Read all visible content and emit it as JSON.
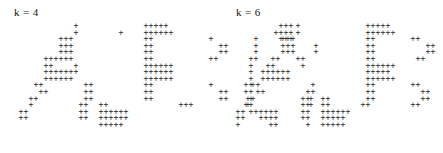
{
  "figure": {
    "glyph": "+",
    "glyph_color": "#262626",
    "background_color": "#ffffff",
    "cell_width": 5,
    "cell_height": 6.6,
    "grid_origin_x": 12,
    "grid_origin_y": 0
  },
  "panels": [
    {
      "id": "panel-left",
      "label": "k = 4",
      "rows": [
        "            +             +++++                      +++       ",
        "            +        +    ++++++                    ++++       ",
        "         +++              ++           +        +    +++       ",
        "         +++              ++             ++     +           +  ",
        "         +++              ++             ++     +           +  ",
        "      ++++++              ++           ++      ++              ",
        "      ++    +             ++++++               +               ",
        "      +++++++             ++++++               +               ",
        "      ++++++              ++++++               +               ",
        "    ++        ++          ++           +      ++               ",
        "     ++       ++          ++             ++   ++               ",
        "   ++         ++          ++             ++    +           +   ",
        "   +         ++  ++              +++          ++           +   ",
        " ++          ++  ++++++                        ++++++          ",
        " ++          ++  ++++++                          ++++          ",
        "                 +++++                             ++          "
      ]
    },
    {
      "id": "panel-right",
      "label": "k = 6",
      "rows": [
        "            +             +++++                     ++++       ",
        "            +             ++++++                   +++++       ",
        "         +++              ++       ++             ++ +++       ",
        "         +++              ++          ++        +          +   ",
        "         +++              ++          ++        +          +   ",
        "       ++   ++            ++        ++         ++              ",
        "      ++     +            ++++++               +               ",
        "     ++++++               +++++                +               ",
        "     ++++++               ++++++               +               ",
        "   ++          +          ++       ++         ++               ",
        "    ++        ++          ++         ++       ++               ",
        "  ++         ++  ++       ++         ++        +          +    ",
        "  +          ++  ++      ++        ++         +++      ++      ",
        "++           ++  ++++++                        ++++++          ",
        "++           ++  +++++                           +++           ",
        "+             +  +++++                            +            "
      ]
    }
  ]
}
